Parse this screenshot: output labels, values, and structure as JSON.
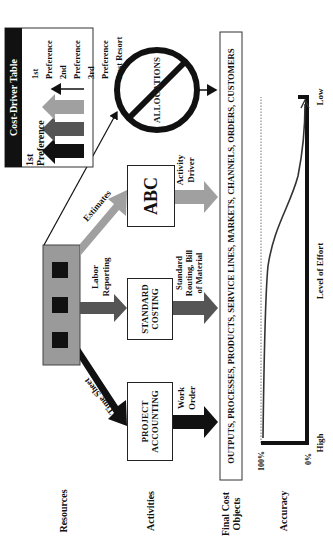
{
  "legend": {
    "title": "Cost-Driver Table",
    "items": [
      {
        "label": "1st Preference",
        "color": "#111111"
      },
      {
        "label": "2nd Preference",
        "color": "#555555"
      },
      {
        "label": "3rd Preference",
        "color": "#a0a0a0"
      },
      {
        "label": "Last Resort",
        "color": "#111111"
      }
    ]
  },
  "rows": {
    "resources": "Resources",
    "activities": "Activities",
    "final_cost_objects": "Final Cost Objects",
    "accuracy": "Accuracy"
  },
  "arrows": {
    "time_sheet": "Time Sheet",
    "labor_reporting": "Labor Reporting",
    "estimates": "Estimates",
    "work_order": "Work Order",
    "standard_routing": "Standard Routing, Bill of Material",
    "activity_driver": "Activity Driver"
  },
  "activities": {
    "project_accounting": "PROJECT ACCOUNTING",
    "standard_costing": "STANDARD COSTING",
    "abc": "ABC",
    "allocations": "ALLOCATIONS"
  },
  "final_cost_objects_text": "OUTPUTS, PROCESSES, PRODUCTS, SERVICE LINES, MARKETS, CHANNELS, ORDERS, CUSTOMERS",
  "chart": {
    "y_top": "100%",
    "y_bottom": "0%",
    "x_left": "High",
    "x_right": "Low",
    "x_label": "Level of Effort"
  },
  "colors": {
    "resource_box": "#9a9a9a",
    "dark": "#111111",
    "mid": "#555555",
    "light": "#a0a0a0"
  }
}
